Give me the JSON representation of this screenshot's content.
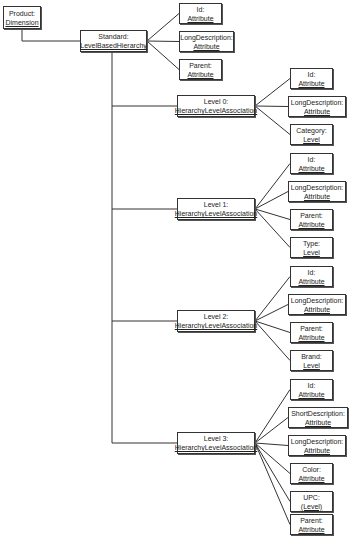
{
  "diagram": {
    "nodes": [
      {
        "id": "product",
        "name": "Product:",
        "type": "Dimension",
        "x": 3,
        "y": 6,
        "w": 38,
        "h": 23
      },
      {
        "id": "standard",
        "name": "Standard:",
        "type": "LevelBasedHierarchy",
        "x": 80,
        "y": 30,
        "w": 67,
        "h": 22
      },
      {
        "id": "std_id",
        "name": "Id:",
        "type": "Attribute",
        "x": 179,
        "y": 3,
        "w": 43,
        "h": 21
      },
      {
        "id": "std_longdesc",
        "name": "LongDescription:",
        "type": "Attribute",
        "x": 179,
        "y": 31,
        "w": 55,
        "h": 21
      },
      {
        "id": "std_parent",
        "name": "Parent:",
        "type": "Attribute",
        "x": 179,
        "y": 59,
        "w": 43,
        "h": 21
      },
      {
        "id": "level0",
        "name": "Level 0:",
        "type": "HierarchyLevelAssociation",
        "x": 177,
        "y": 95,
        "w": 78,
        "h": 22
      },
      {
        "id": "l0_id",
        "name": "Id:",
        "type": "Attribute",
        "x": 290,
        "y": 68,
        "w": 43,
        "h": 21
      },
      {
        "id": "l0_longdesc",
        "name": "LongDescription:",
        "type": "Attribute",
        "x": 288,
        "y": 96,
        "w": 58,
        "h": 21
      },
      {
        "id": "l0_category",
        "name": "Category:",
        "type": "Level",
        "x": 290,
        "y": 124,
        "w": 43,
        "h": 21
      },
      {
        "id": "level1",
        "name": "Level 1:",
        "type": "HierarchyLevelAssociation",
        "x": 177,
        "y": 198,
        "w": 78,
        "h": 22
      },
      {
        "id": "l1_id",
        "name": "Id:",
        "type": "Attribute",
        "x": 290,
        "y": 153,
        "w": 43,
        "h": 21
      },
      {
        "id": "l1_longdesc",
        "name": "LongDescription:",
        "type": "Attribute",
        "x": 288,
        "y": 181,
        "w": 58,
        "h": 21
      },
      {
        "id": "l1_parent",
        "name": "Parent:",
        "type": "Attribute",
        "x": 290,
        "y": 209,
        "w": 43,
        "h": 21
      },
      {
        "id": "l1_type",
        "name": "Type:",
        "type": "Level",
        "x": 290,
        "y": 237,
        "w": 43,
        "h": 21
      },
      {
        "id": "level2",
        "name": "Level 2:",
        "type": "HierarchyLevelAssociation",
        "x": 177,
        "y": 310,
        "w": 78,
        "h": 22
      },
      {
        "id": "l2_id",
        "name": "Id:",
        "type": "Attribute",
        "x": 290,
        "y": 266,
        "w": 43,
        "h": 21
      },
      {
        "id": "l2_longdesc",
        "name": "LongDescription:",
        "type": "Attribute",
        "x": 288,
        "y": 294,
        "w": 58,
        "h": 21
      },
      {
        "id": "l2_parent",
        "name": "Parent:",
        "type": "Attribute",
        "x": 290,
        "y": 322,
        "w": 43,
        "h": 21
      },
      {
        "id": "l2_brand",
        "name": "Brand:",
        "type": "Level",
        "x": 290,
        "y": 350,
        "w": 43,
        "h": 21
      },
      {
        "id": "level3",
        "name": "Level 3:",
        "type": "HierarchyLevelAssociation",
        "x": 177,
        "y": 432,
        "w": 78,
        "h": 22
      },
      {
        "id": "l3_id",
        "name": "Id:",
        "type": "Attribute",
        "x": 290,
        "y": 379,
        "w": 43,
        "h": 21
      },
      {
        "id": "l3_shortdesc",
        "name": "ShortDescription:",
        "type": "Attribute",
        "x": 288,
        "y": 407,
        "w": 60,
        "h": 21
      },
      {
        "id": "l3_longdesc",
        "name": "LongDescription:",
        "type": "Attribute",
        "x": 288,
        "y": 435,
        "w": 58,
        "h": 21
      },
      {
        "id": "l3_color",
        "name": "Color:",
        "type": "Attribute",
        "x": 290,
        "y": 463,
        "w": 43,
        "h": 21
      },
      {
        "id": "l3_upc",
        "name": "UPC:",
        "type": "(Level)",
        "x": 290,
        "y": 491,
        "w": 43,
        "h": 21
      },
      {
        "id": "l3_parent",
        "name": "Parent:",
        "type": "Attribute",
        "x": 290,
        "y": 514,
        "w": 43,
        "h": 21
      }
    ],
    "edges": [
      [
        "product",
        "standard"
      ],
      [
        "standard",
        "std_id"
      ],
      [
        "standard",
        "std_longdesc"
      ],
      [
        "standard",
        "std_parent"
      ],
      [
        "standard",
        "level0"
      ],
      [
        "standard",
        "level1"
      ],
      [
        "standard",
        "level2"
      ],
      [
        "standard",
        "level3"
      ],
      [
        "level0",
        "l0_id"
      ],
      [
        "level0",
        "l0_longdesc"
      ],
      [
        "level0",
        "l0_category"
      ],
      [
        "level1",
        "l1_id"
      ],
      [
        "level1",
        "l1_longdesc"
      ],
      [
        "level1",
        "l1_parent"
      ],
      [
        "level1",
        "l1_type"
      ],
      [
        "level2",
        "l2_id"
      ],
      [
        "level2",
        "l2_longdesc"
      ],
      [
        "level2",
        "l2_parent"
      ],
      [
        "level2",
        "l2_brand"
      ],
      [
        "level3",
        "l3_id"
      ],
      [
        "level3",
        "l3_shortdesc"
      ],
      [
        "level3",
        "l3_longdesc"
      ],
      [
        "level3",
        "l3_color"
      ],
      [
        "level3",
        "l3_upc"
      ],
      [
        "level3",
        "l3_parent"
      ]
    ],
    "colors": {
      "line": "#333333",
      "border": "#333333",
      "background": "#ffffff",
      "text": "#222222"
    }
  }
}
